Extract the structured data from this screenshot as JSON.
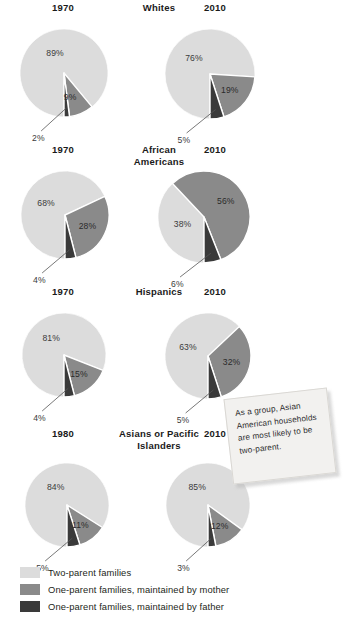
{
  "legend": {
    "items": [
      {
        "label": "Two-parent families",
        "color": "#dcdcdc",
        "key": "two_parent"
      },
      {
        "label": "One-parent families, maintained by mother",
        "color": "#8a8a8a",
        "key": "mother"
      },
      {
        "label": "One-parent families, maintained by father",
        "color": "#3a3a3a",
        "key": "father"
      }
    ]
  },
  "callout": {
    "text": "As a group, Asian American households are most likely to be two-parent."
  },
  "groups": [
    {
      "title": "Whites",
      "left": {
        "year": "1970",
        "values": [
          89,
          9,
          2
        ],
        "labels": [
          "89%",
          "9%",
          "2%"
        ]
      },
      "right": {
        "year": "2010",
        "values": [
          76,
          19,
          5
        ],
        "labels": [
          "76%",
          "19%",
          "5%"
        ]
      }
    },
    {
      "title": "African\nAmericans",
      "left": {
        "year": "1970",
        "values": [
          68,
          28,
          4
        ],
        "labels": [
          "68%",
          "28%",
          "4%"
        ]
      },
      "right": {
        "year": "2010",
        "values": [
          38,
          56,
          6
        ],
        "labels": [
          "38%",
          "56%",
          "6%"
        ]
      }
    },
    {
      "title": "Hispanics",
      "left": {
        "year": "1970",
        "values": [
          81,
          15,
          4
        ],
        "labels": [
          "81%",
          "15%",
          "4%"
        ]
      },
      "right": {
        "year": "2010",
        "values": [
          63,
          32,
          5
        ],
        "labels": [
          "63%",
          "32%",
          "5%"
        ]
      }
    },
    {
      "title": "Asians or Pacific\nIslanders",
      "left": {
        "year": "1980",
        "values": [
          84,
          11,
          5
        ],
        "labels": [
          "84%",
          "11%",
          "5%"
        ]
      },
      "right": {
        "year": "2010",
        "values": [
          85,
          12,
          3
        ],
        "labels": [
          "85%",
          "12%",
          "3%"
        ]
      }
    }
  ],
  "chart_data": {
    "type": "pie",
    "categories": [
      "Two-parent families",
      "One-parent families, maintained by mother",
      "One-parent families, maintained by father"
    ],
    "colors": [
      "#dcdcdc",
      "#8a8a8a",
      "#3a3a3a"
    ],
    "unit": "percent",
    "legend_position": "bottom-left",
    "grid": false,
    "annotations": [
      "As a group, Asian American households are most likely to be two-parent."
    ],
    "charts": [
      {
        "group": "Whites",
        "year": "1970",
        "values": [
          89,
          9,
          2
        ]
      },
      {
        "group": "Whites",
        "year": "2010",
        "values": [
          76,
          19,
          5
        ]
      },
      {
        "group": "African Americans",
        "year": "1970",
        "values": [
          68,
          28,
          4
        ]
      },
      {
        "group": "African Americans",
        "year": "2010",
        "values": [
          38,
          56,
          6
        ]
      },
      {
        "group": "Hispanics",
        "year": "1970",
        "values": [
          81,
          15,
          4
        ]
      },
      {
        "group": "Hispanics",
        "year": "2010",
        "values": [
          63,
          32,
          5
        ]
      },
      {
        "group": "Asians or Pacific Islanders",
        "year": "1980",
        "values": [
          84,
          11,
          5
        ]
      },
      {
        "group": "Asians or Pacific Islanders",
        "year": "2010",
        "values": [
          85,
          12,
          3
        ]
      }
    ]
  }
}
